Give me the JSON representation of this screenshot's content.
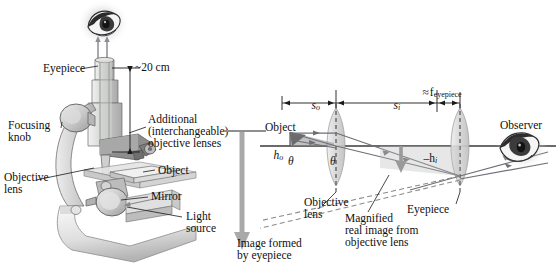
{
  "figure": {
    "title_semantic": "compound-microscope-diagram",
    "background": "#ffffff",
    "width": 556,
    "height": 270,
    "ink": "#1a1a1a",
    "gray_fill": "#b9b9b9",
    "ray_color": "#6f6f78",
    "dash_color": "#8a8a8a"
  },
  "left_panel": {
    "name": "microscope-illustration",
    "labels": {
      "eyepiece": "Eyepiece",
      "distance": "~20 cm",
      "focusing_knob_line1": "Focusing",
      "focusing_knob_line2": "knob",
      "additional_line1": "Additional",
      "additional_line2": "(interchangeable)",
      "additional_line3": "objective lenses",
      "objective_lens_line1": "Objective",
      "objective_lens_line2": "lens",
      "object": "Object",
      "mirror": "Mirror",
      "light_source_line1": "Light",
      "light_source_line2": "source"
    },
    "icons": {
      "eye": "eye-icon",
      "up_arrows": "light-ray-up-arrow-icon"
    }
  },
  "right_panel": {
    "name": "ray-diagram",
    "dimensions": [
      {
        "id": "s_o",
        "symbol": "s",
        "subscript": "o",
        "approx": false
      },
      {
        "id": "s_i",
        "symbol": "s",
        "subscript": "i",
        "approx": false
      },
      {
        "id": "f_eyepiece",
        "symbol": "f",
        "subscript": "eyepiece",
        "approx": true,
        "approx_glyph": "≈"
      }
    ],
    "labels": {
      "object": "Object",
      "h_o_symbol": "h",
      "h_o_sub": "o",
      "h_i_prefix": "–",
      "h_i_symbol": "h",
      "h_i_sub": "i",
      "theta1": "θ",
      "theta2": "θ",
      "objective_lens_line1": "Objective",
      "objective_lens_line2": "lens",
      "eyepiece": "Eyepiece",
      "observer": "Observer",
      "image_formed_line1": "Image formed",
      "image_formed_line2": "by eyepiece",
      "magnified_line1": "Magnified",
      "magnified_line2": "real image from",
      "magnified_line3": "objective lens"
    },
    "icons": {
      "eye": "observer-eye-icon",
      "lens_objective": "biconvex-lens-icon",
      "lens_eyepiece": "biconvex-lens-icon",
      "image_arrow_left": "inverted-image-arrow-icon",
      "image_arrow_mid": "inverted-image-arrow-icon"
    }
  }
}
